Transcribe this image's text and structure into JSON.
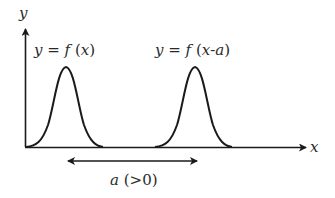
{
  "diagram": {
    "type": "function-translation",
    "axes": {
      "y_label": "y",
      "x_label": "x"
    },
    "curves": [
      {
        "label": "y = f(x)",
        "label_parts": [
          "y",
          " = ",
          "f",
          " (",
          "x",
          ")"
        ],
        "peak_x": 66
      },
      {
        "label": "y = f(x-a)",
        "label_parts": [
          "y",
          " = ",
          "f",
          " (",
          "x",
          "-",
          "a",
          ")"
        ],
        "peak_x": 195
      }
    ],
    "shift": {
      "label": "a (>0)",
      "label_var": "a",
      "label_rest": " (>0)",
      "direction": "both-arrows"
    },
    "colors": {
      "stroke": "#1a1a1a",
      "text": "#2a2a2a",
      "background": "#ffffff"
    }
  }
}
